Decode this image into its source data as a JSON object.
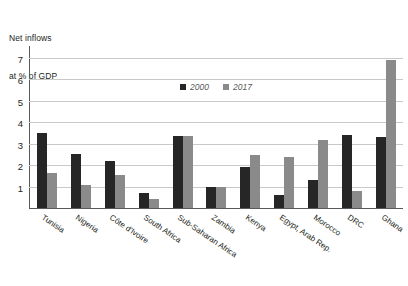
{
  "chart_data": {
    "type": "bar",
    "title": "",
    "axis_title_lines": [
      "Net inflows",
      "at % of GDP"
    ],
    "ylabel": "Net inflows at % of GDP",
    "xlabel": "",
    "ylim": [
      0,
      7.6
    ],
    "yticks": [
      1,
      2,
      3,
      4,
      5,
      6,
      7
    ],
    "ytick_labels": [
      "1",
      "2",
      "3",
      "4",
      "5",
      "6",
      "7"
    ],
    "grid": true,
    "legend_position": "top-center",
    "categories": [
      "Tunisia",
      "Nigeria",
      "Côte d'Ivoire",
      "South Africa",
      "Sub-Saharan Africa",
      "Zambia",
      "Kenya",
      "Egypt, Arab Rep.",
      "Morocco",
      "DRC",
      "Ghana"
    ],
    "series": [
      {
        "name": "2000",
        "color": "#262626",
        "values": [
          3.5,
          2.5,
          2.2,
          0.7,
          3.35,
          1.0,
          1.9,
          0.6,
          1.3,
          3.4,
          3.3
        ]
      },
      {
        "name": "2017",
        "color": "#8a8a8a",
        "values": [
          1.65,
          1.05,
          1.55,
          0.4,
          3.35,
          1.0,
          2.45,
          2.4,
          3.15,
          0.8,
          6.9
        ]
      }
    ]
  },
  "legend": {
    "items": [
      {
        "label": "2000",
        "color": "#262626"
      },
      {
        "label": "2017",
        "color": "#8a8a8a"
      }
    ]
  },
  "colors": {
    "series_2000": "#262626",
    "series_2017": "#8a8a8a",
    "gridline": "#c9c9c9",
    "axis": "#58595b",
    "text": "#231f20",
    "background": "#ffffff"
  }
}
